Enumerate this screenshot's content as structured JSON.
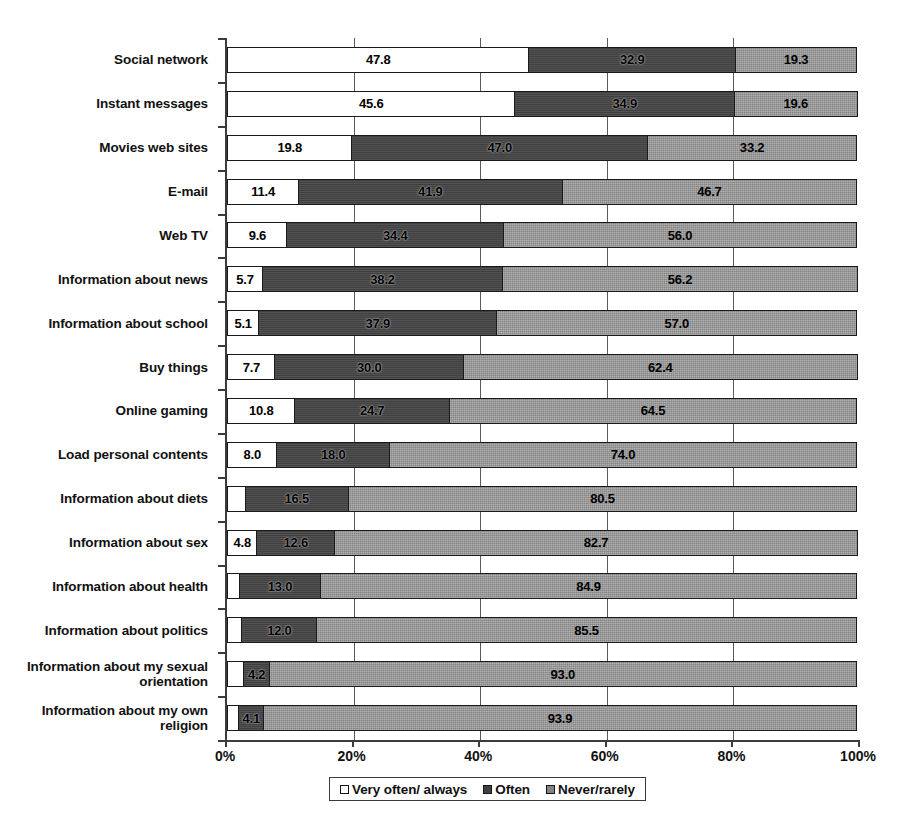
{
  "chart_data": {
    "type": "bar",
    "subtype": "horizontal-stacked-100-percent",
    "title": "",
    "xlabel": "",
    "ylabel": "",
    "xlim": [
      0,
      100
    ],
    "xticks": [
      "0%",
      "20%",
      "40%",
      "60%",
      "80%",
      "100%"
    ],
    "xtick_values": [
      0,
      20,
      40,
      60,
      80,
      100
    ],
    "grid": true,
    "grid_axis": "x",
    "legend_position": "bottom-center",
    "categories": [
      "Social network",
      "Instant messages",
      "Movies web sites",
      "E-mail",
      "Web TV",
      "Information about news",
      "Information about school",
      "Buy things",
      "Online gaming",
      "Load personal contents",
      "Information about diets",
      "Information about sex",
      "Information about health",
      "Information about politics",
      "Information about my sexual orientation",
      "Information about my own religion"
    ],
    "series": [
      {
        "name": "Very often/ always",
        "color": "#ffffff",
        "values": [
          47.8,
          45.6,
          19.8,
          11.4,
          9.6,
          5.7,
          5.1,
          7.7,
          10.8,
          8.0,
          3.0,
          4.8,
          2.1,
          2.5,
          2.8,
          2.0
        ],
        "labels": [
          "47.8",
          "45.6",
          "19.8",
          "11.4",
          "9.6",
          "5.7",
          "5.1",
          "7.7",
          "10.8",
          "8.0",
          "",
          "4.8",
          "",
          "",
          "",
          ""
        ]
      },
      {
        "name": "Often",
        "color": "#3f3f3f",
        "values": [
          32.9,
          34.9,
          47.0,
          41.9,
          34.4,
          38.2,
          37.9,
          30.0,
          24.7,
          18.0,
          16.5,
          12.6,
          13.0,
          12.0,
          4.2,
          4.1
        ],
        "labels": [
          "32.9",
          "34.9",
          "47.0",
          "41.9",
          "34.4",
          "38.2",
          "37.9",
          "30.0",
          "24.7",
          "18.0",
          "16.5",
          "12.6",
          "13.0",
          "12.0",
          "4.2",
          "4.1"
        ]
      },
      {
        "name": "Never/rarely",
        "color": "#838383",
        "values": [
          19.3,
          19.6,
          33.2,
          46.7,
          56.0,
          56.2,
          57.0,
          62.4,
          64.5,
          74.0,
          80.5,
          82.7,
          84.9,
          85.5,
          93.0,
          93.9
        ],
        "labels": [
          "19.3",
          "19.6",
          "33.2",
          "46.7",
          "56.0",
          "56.2",
          "57.0",
          "62.4",
          "64.5",
          "74.0",
          "80.5",
          "82.7",
          "84.9",
          "85.5",
          "93.0",
          "93.9"
        ]
      }
    ]
  },
  "legend": {
    "items": [
      {
        "label": "Very often/ always",
        "swatch": "sw-very"
      },
      {
        "label": "Often",
        "swatch": "sw-often"
      },
      {
        "label": "Never/rarely",
        "swatch": "sw-never"
      }
    ]
  },
  "colors": {
    "very_often": "#ffffff",
    "often": "#3f3f3f",
    "never_rarely": "#838383",
    "axis": "#3b3b3b",
    "background": "#ffffff"
  }
}
